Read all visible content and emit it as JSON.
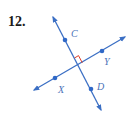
{
  "problem": {
    "number": "12."
  },
  "colors": {
    "line": "#3b6fc4",
    "point": "#2f68c7",
    "label": "#4a72b8",
    "right_angle": "#e0402a",
    "number": "#1a1a1a"
  },
  "diagram": {
    "lines": [
      {
        "name": "CD",
        "from": [
          53,
          17
        ],
        "to": [
          101,
          110
        ]
      },
      {
        "name": "XY",
        "from": [
          34,
          90
        ],
        "to": [
          125,
          37
        ]
      }
    ],
    "points": [
      {
        "label": "C",
        "x": 65,
        "y": 40
      },
      {
        "label": "D",
        "x": 91,
        "y": 89
      },
      {
        "label": "X",
        "x": 55,
        "y": 78
      },
      {
        "label": "Y",
        "x": 102,
        "y": 51
      }
    ],
    "labels": {
      "C": "C",
      "D": "D",
      "X": "X",
      "Y": "Y"
    },
    "right_angle_marker": true
  }
}
